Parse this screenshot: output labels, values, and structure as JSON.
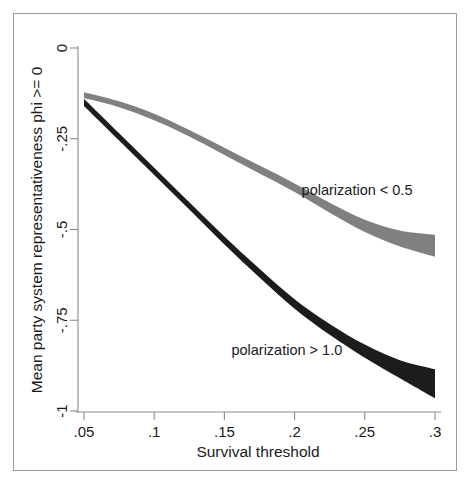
{
  "chart_data": {
    "type": "line",
    "title": "",
    "xlabel": "Survival threshold",
    "ylabel": "Mean party system representativeness phi >= 0",
    "xlim": [
      0.05,
      0.3
    ],
    "ylim": [
      -1,
      0
    ],
    "xticks": [
      ".05",
      ".1",
      ".15",
      ".2",
      ".25",
      ".3"
    ],
    "xtick_values": [
      0.05,
      0.1,
      0.15,
      0.2,
      0.25,
      0.3
    ],
    "yticks": [
      "0",
      "-.25",
      "-.5",
      "-.75",
      "-1"
    ],
    "ytick_values": [
      0,
      -0.25,
      -0.5,
      -0.75,
      -1
    ],
    "grid": false,
    "legend_position": "inline-annotation",
    "x": [
      0.05,
      0.075,
      0.1,
      0.125,
      0.15,
      0.175,
      0.2,
      0.225,
      0.25,
      0.275,
      0.3
    ],
    "series": [
      {
        "name": "polarization < 0.5",
        "color": "#808080",
        "values": [
          -0.13,
          -0.155,
          -0.19,
          -0.235,
          -0.285,
          -0.335,
          -0.385,
          -0.44,
          -0.49,
          -0.525,
          -0.545
        ],
        "band_halfwidth": [
          0.008,
          0.008,
          0.009,
          0.009,
          0.01,
          0.011,
          0.012,
          0.014,
          0.017,
          0.022,
          0.03
        ]
      },
      {
        "name": "polarization > 1.0",
        "color": "#1c1c1c",
        "values": [
          -0.15,
          -0.245,
          -0.34,
          -0.435,
          -0.53,
          -0.62,
          -0.705,
          -0.775,
          -0.835,
          -0.885,
          -0.925
        ],
        "band_halfwidth": [
          0.01,
          0.01,
          0.01,
          0.01,
          0.011,
          0.012,
          0.013,
          0.015,
          0.018,
          0.025,
          0.04
        ]
      }
    ],
    "annotations": [
      {
        "text": "polarization < 0.5",
        "x": 0.205,
        "y": -0.405,
        "series": "polarization < 0.5"
      },
      {
        "text": "polarization > 1.0",
        "x": 0.155,
        "y": -0.845,
        "series": "polarization > 1.0"
      }
    ]
  },
  "axes": {
    "x_title": "Survival threshold",
    "y_title": "Mean party system representativeness phi >= 0",
    "xtick_labels": [
      ".05",
      ".1",
      ".15",
      ".2",
      ".25",
      ".3"
    ],
    "ytick_labels": [
      "0",
      "-.25",
      "-.5",
      "-.75",
      "-1"
    ]
  },
  "annotations": {
    "light_series_label": "polarization < 0.5",
    "dark_series_label": "polarization > 1.0"
  },
  "colors": {
    "light_band": "#808080",
    "dark_band": "#1c1c1c",
    "axis": "#8c8c8c",
    "frame": "#9a9a9a",
    "text": "#1a1a1a",
    "background": "#ffffff"
  }
}
